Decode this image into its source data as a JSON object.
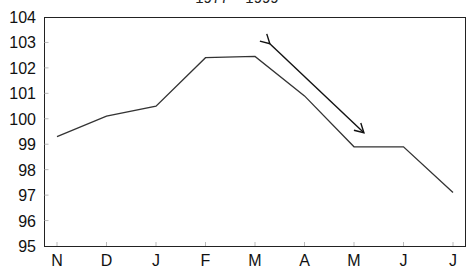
{
  "chart_data": {
    "type": "line",
    "title": "1977 – 1999",
    "xlabel": "",
    "ylabel": "",
    "categories": [
      "N",
      "D",
      "J",
      "F",
      "M",
      "A",
      "M",
      "J",
      "J"
    ],
    "series": [
      {
        "name": "index",
        "values": [
          99.3,
          100.1,
          100.5,
          102.4,
          102.45,
          100.9,
          98.9,
          98.9,
          97.1
        ]
      }
    ],
    "ylim": [
      95,
      104
    ],
    "yticks": [
      95,
      96,
      97,
      98,
      99,
      100,
      101,
      102,
      103,
      104
    ],
    "grid": false,
    "legend": "none",
    "annotations": [
      {
        "type": "double-arrow",
        "from": {
          "category_index": 4.3,
          "value": 102.95
        },
        "to": {
          "category_index": 6.2,
          "value": 99.45
        }
      }
    ]
  },
  "colors": {
    "line": "#333333",
    "axis": "#222222",
    "arrow": "#111111"
  }
}
